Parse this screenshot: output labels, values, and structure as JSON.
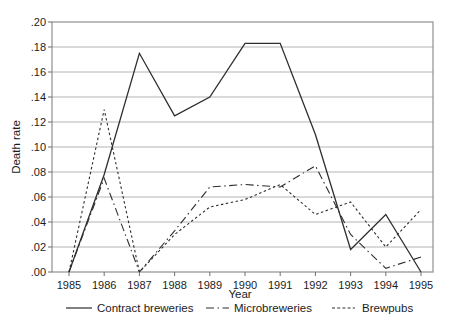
{
  "chart_data": {
    "type": "line",
    "title": "",
    "xlabel": "Year",
    "ylabel": "Death rate",
    "x": [
      1985,
      1986,
      1987,
      1988,
      1989,
      1990,
      1991,
      1992,
      1993,
      1994,
      1995
    ],
    "y_tick_labels": [
      ".00",
      ".02",
      ".04",
      ".06",
      ".08",
      ".10",
      ".12",
      ".14",
      ".16",
      ".18",
      ".20"
    ],
    "ylim": [
      0,
      0.2
    ],
    "y_tick_step": 0.02,
    "grid": "horizontal",
    "legend_position": "bottom",
    "series": [
      {
        "name": "Contract breweries",
        "style": "solid",
        "values": [
          0.0,
          0.078,
          0.175,
          0.125,
          0.14,
          0.183,
          0.183,
          0.11,
          0.018,
          0.046,
          0.0
        ]
      },
      {
        "name": "Microbreweries",
        "style": "dash-dot",
        "values": [
          0.0,
          0.075,
          0.0,
          0.033,
          0.068,
          0.07,
          0.068,
          0.085,
          0.03,
          0.003,
          0.012
        ]
      },
      {
        "name": "Brewpubs",
        "style": "dashed",
        "values": [
          0.0,
          0.13,
          0.0,
          0.03,
          0.052,
          0.058,
          0.07,
          0.046,
          0.056,
          0.02,
          0.05
        ]
      }
    ],
    "colors": {
      "line": "#2e2e2e",
      "grid": "#b4b4b4",
      "frame": "#8f8f8f",
      "text": "#1c1c1c",
      "background": "#ffffff"
    }
  }
}
